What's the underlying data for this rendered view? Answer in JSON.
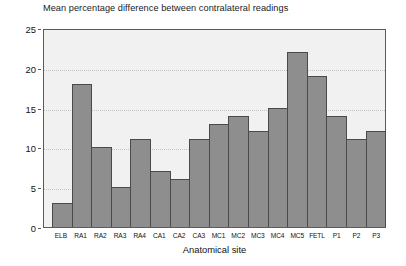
{
  "chart_data": {
    "type": "bar",
    "title": "Mean percentage difference between contralateral readings",
    "xlabel": "Anatomical site",
    "ylabel": "",
    "categories": [
      "ELB",
      "RA1",
      "RA2",
      "RA3",
      "RA4",
      "CA1",
      "CA2",
      "CA3",
      "MC1",
      "MC2",
      "MC3",
      "MC4",
      "MC5",
      "FETL",
      "P1",
      "P2",
      "P3"
    ],
    "values": [
      3,
      18,
      10,
      5,
      11,
      7,
      6,
      11,
      13,
      14,
      12,
      15,
      22,
      19,
      14,
      11,
      12
    ],
    "ylim": [
      0,
      25
    ],
    "ytick_labels": [
      "0",
      "5",
      "10",
      "15",
      "20",
      "25"
    ],
    "ytick_values": [
      0,
      5,
      10,
      15,
      20,
      25
    ],
    "grid": true,
    "grid_axis": "y",
    "legend": null,
    "legend_position": "none",
    "bar_color": "#8e8e8e",
    "bar_edge_color": "#4a4a4a",
    "plot_background": "#f1f1f1",
    "frame_color": "#5a5a5a",
    "gridline_color": "#c2c2c2"
  }
}
